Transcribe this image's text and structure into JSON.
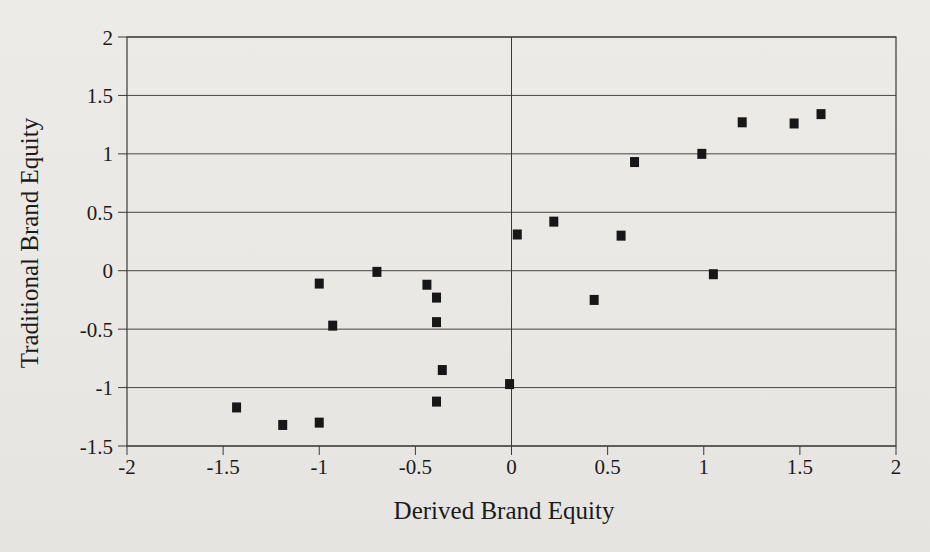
{
  "figure": {
    "background_color": "#eae8e4",
    "grid_color": "#474747",
    "axis_color": "#3a3a3a",
    "marker_color": "#171717",
    "text_color": "#1b1b1b"
  },
  "chart_data": {
    "type": "scatter",
    "title": "",
    "xlabel": "Derived Brand Equity",
    "ylabel": "Traditional Brand Equity",
    "xlim": [
      -2,
      2
    ],
    "ylim": [
      -1.5,
      2
    ],
    "x_tick_values": [
      -2,
      -1.5,
      -1,
      -0.5,
      0,
      0.5,
      1,
      1.5,
      2
    ],
    "x_tick_labels": [
      "-2",
      "-1.5",
      "-1",
      "-0.5",
      "0",
      "0.5",
      "1",
      "1.5",
      "2"
    ],
    "y_tick_values": [
      2,
      1.5,
      1,
      0.5,
      0,
      -0.5,
      -1,
      -1.5
    ],
    "y_tick_labels": [
      "2",
      "1.5",
      "1",
      "0.5",
      "0",
      "-0.5",
      "-1",
      "-1.5"
    ],
    "grid": "horizontal-gridlines-plus-zero-vertical",
    "legend": "none",
    "marker": "filled-square",
    "points": [
      {
        "x": -1.43,
        "y": -1.17
      },
      {
        "x": -1.19,
        "y": -1.32
      },
      {
        "x": -1.0,
        "y": -1.3
      },
      {
        "x": -1.0,
        "y": -0.11
      },
      {
        "x": -0.93,
        "y": -0.47
      },
      {
        "x": -0.7,
        "y": -0.01
      },
      {
        "x": -0.44,
        "y": -0.12
      },
      {
        "x": -0.39,
        "y": -0.23
      },
      {
        "x": -0.39,
        "y": -0.44
      },
      {
        "x": -0.39,
        "y": -1.12
      },
      {
        "x": -0.36,
        "y": -0.85
      },
      {
        "x": -0.01,
        "y": -0.97
      },
      {
        "x": 0.03,
        "y": 0.31
      },
      {
        "x": 0.22,
        "y": 0.42
      },
      {
        "x": 0.43,
        "y": -0.25
      },
      {
        "x": 0.57,
        "y": 0.3
      },
      {
        "x": 0.64,
        "y": 0.93
      },
      {
        "x": 0.99,
        "y": 1.0
      },
      {
        "x": 1.05,
        "y": -0.03
      },
      {
        "x": 1.2,
        "y": 1.27
      },
      {
        "x": 1.47,
        "y": 1.26
      },
      {
        "x": 1.61,
        "y": 1.34
      }
    ]
  }
}
